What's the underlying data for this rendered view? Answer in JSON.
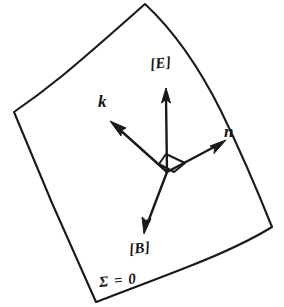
{
  "figure": {
    "kind": "line-diagram",
    "background_color": "#ffffff",
    "ink_color": "#1a1a1a"
  },
  "surface": {
    "name": "wavefront-surface",
    "label": "Σ = 0",
    "outline_path": "M 145 4 C 104 40 58 77 14 112 C 36 169 64 243 96 302 C 148 278 214 253 272 227 C 246 161 202 78 145 4 Z"
  },
  "vectors": [
    {
      "id": "E",
      "label": "[E]",
      "name": "vector-E",
      "direction": "up",
      "origin": [
        167,
        172
      ],
      "tip": [
        166,
        92
      ]
    },
    {
      "id": "k",
      "label": "k",
      "name": "vector-k",
      "direction": "up-left",
      "origin": [
        167,
        172
      ],
      "tip": [
        113,
        124
      ]
    },
    {
      "id": "n",
      "label": "n",
      "name": "vector-n",
      "direction": "up-right",
      "origin": [
        167,
        172
      ],
      "tip": [
        224,
        141
      ]
    },
    {
      "id": "B",
      "label": "[B]",
      "name": "vector-B",
      "direction": "down-left",
      "origin": [
        167,
        172
      ],
      "tip": [
        144,
        233
      ]
    }
  ],
  "markers": {
    "right_angle": {
      "name": "right-angle-marker",
      "description": "small parallelogram between the E and n vectors indicating perpendicularity",
      "path": "M 166 155 L 184 163 L 173 172 L 160 165 Z"
    }
  }
}
